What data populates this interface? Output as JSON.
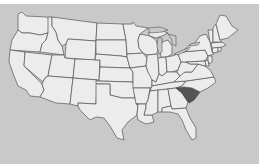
{
  "map": {
    "title": "United States",
    "highlighted_state": "South Carolina",
    "colors": {
      "background": "#c9c9c9",
      "top_strip": "#ffffff",
      "state_fill": "#ececec",
      "border": "#555555",
      "highlight": "#555555"
    },
    "states": [
      "Washington",
      "Oregon",
      "California",
      "Idaho",
      "Nevada",
      "Montana",
      "Wyoming",
      "Utah",
      "Arizona",
      "Colorado",
      "New Mexico",
      "North Dakota",
      "South Dakota",
      "Nebraska",
      "Kansas",
      "Oklahoma",
      "Texas",
      "Minnesota",
      "Iowa",
      "Missouri",
      "Arkansas",
      "Louisiana",
      "Wisconsin",
      "Illinois",
      "Michigan",
      "Indiana",
      "Ohio",
      "Kentucky",
      "Tennessee",
      "Mississippi",
      "Alabama",
      "Georgia",
      "Florida",
      "South Carolina",
      "North Carolina",
      "Virginia",
      "West Virginia",
      "Pennsylvania",
      "New York",
      "Maryland",
      "Delaware",
      "New Jersey",
      "Connecticut",
      "Rhode Island",
      "Massachusetts",
      "Vermont",
      "New Hampshire",
      "Maine"
    ]
  }
}
